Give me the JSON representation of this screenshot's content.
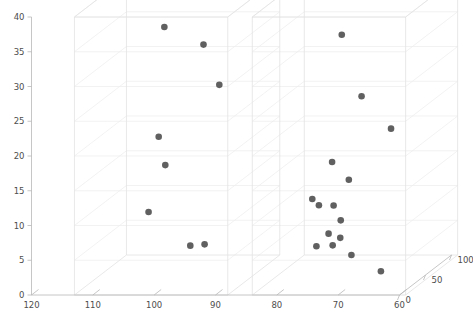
{
  "chart_data": {
    "type": "scatter",
    "title": "",
    "xlabel": "",
    "ylabel": "",
    "zlabel": "",
    "projection": "3d",
    "grid": true,
    "legend": false,
    "legend_position": "none",
    "background_color": "#ffffff",
    "marker_color": "#4a4a4a",
    "grid_color": "#ececec",
    "box_color": "#e2e2e2",
    "axis_color": "#b8b8b8",
    "xlim": [
      120,
      60
    ],
    "ylim": [
      0,
      40
    ],
    "zlim": [
      0,
      100
    ],
    "x_axis_reversed": true,
    "x_ticks": [
      120,
      110,
      100,
      90,
      80,
      70,
      60
    ],
    "y_ticks": [
      0,
      5,
      10,
      15,
      20,
      25,
      30,
      35,
      40
    ],
    "z_ticks": [
      0,
      50,
      100
    ],
    "x_tick_labels": [
      "120",
      "110",
      "100",
      "90",
      "80",
      "70",
      "60"
    ],
    "y_tick_labels": [
      "0",
      "5",
      "10",
      "15",
      "20",
      "25",
      "30",
      "35",
      "40"
    ],
    "z_tick_labels": [
      "0",
      "50",
      "100"
    ],
    "panels": [
      {
        "name": "left-box",
        "x_range": [
          113,
          88
        ],
        "points": [
          {
            "x": 103.0,
            "y": 35.4,
            "z": 55
          },
          {
            "x": 94.5,
            "y": 34.3,
            "z": 30
          },
          {
            "x": 91.5,
            "y": 28.8,
            "z": 25
          },
          {
            "x": 103.5,
            "y": 19.9,
            "z": 50
          },
          {
            "x": 102.0,
            "y": 16.1,
            "z": 45
          },
          {
            "x": 106.0,
            "y": 8.5,
            "z": 60
          },
          {
            "x": 97.5,
            "y": 4.8,
            "z": 40
          },
          {
            "x": 95.0,
            "y": 5.1,
            "z": 38
          }
        ]
      },
      {
        "name": "right-box",
        "x_range": [
          84,
          59
        ],
        "points": [
          {
            "x": 74.5,
            "y": 34.0,
            "z": 60
          },
          {
            "x": 70.0,
            "y": 26.0,
            "z": 45
          },
          {
            "x": 63.5,
            "y": 22.5,
            "z": 25
          },
          {
            "x": 76.5,
            "y": 15.4,
            "z": 65
          },
          {
            "x": 72.5,
            "y": 13.7,
            "z": 50
          },
          {
            "x": 81.0,
            "y": 9.2,
            "z": 80
          },
          {
            "x": 79.5,
            "y": 8.6,
            "z": 75
          },
          {
            "x": 76.0,
            "y": 9.3,
            "z": 62
          },
          {
            "x": 74.5,
            "y": 7.4,
            "z": 58
          },
          {
            "x": 77.5,
            "y": 4.8,
            "z": 70
          },
          {
            "x": 75.0,
            "y": 4.6,
            "z": 63
          },
          {
            "x": 80.5,
            "y": 2.3,
            "z": 82
          },
          {
            "x": 77.0,
            "y": 3.0,
            "z": 72
          },
          {
            "x": 72.5,
            "y": 2.6,
            "z": 55
          },
          {
            "x": 66.0,
            "y": 1.4,
            "z": 35
          }
        ]
      }
    ]
  },
  "axes": {
    "y_axis_name": "vertical-value-axis",
    "x_axis_name": "horizontal-category-axis",
    "z_axis_name": "depth-axis"
  }
}
